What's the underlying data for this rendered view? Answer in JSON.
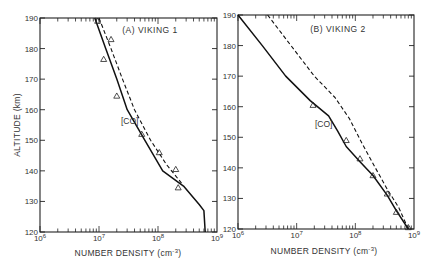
{
  "chart_data": [
    {
      "type": "line",
      "title": "(A) VIKING 1",
      "xlabel": "NUMBER DENSITY (cm⁻³)",
      "ylabel": "ALTITUDE (km)",
      "xscale": "log",
      "xlim": [
        1000000.0,
        1000000000.0
      ],
      "ylim": [
        120,
        190
      ],
      "x_tick_labels": [
        "10⁶",
        "10⁷",
        "10⁸",
        "10⁹"
      ],
      "y_tick_labels": [
        "120",
        "130",
        "140",
        "150",
        "160",
        "170",
        "180",
        "190"
      ],
      "grid": false,
      "annotations": [
        "[CO]"
      ],
      "series": [
        {
          "name": "model (solid)",
          "style": "solid",
          "points": [
            [
              8500000.0,
              190
            ],
            [
              13000000.0,
              180
            ],
            [
              20000000.0,
              170
            ],
            [
              30000000.0,
              160
            ],
            [
              60000000.0,
              150
            ],
            [
              120000000.0,
              140
            ],
            [
              270000000.0,
              135
            ],
            [
              500000000.0,
              129
            ],
            [
              600000000.0,
              127
            ],
            [
              630000000.0,
              120
            ]
          ]
        },
        {
          "name": "model (dashed)",
          "style": "dashed",
          "points": [
            [
              10000000.0,
              190
            ],
            [
              16000000.0,
              180
            ],
            [
              25000000.0,
              170
            ],
            [
              40000000.0,
              160
            ],
            [
              75000000.0,
              150
            ],
            [
              140000000.0,
              142
            ],
            [
              250000000.0,
              136
            ]
          ]
        },
        {
          "name": "measured",
          "style": "triangle-markers",
          "points": [
            [
              9500000.0,
              189
            ],
            [
              16000000.0,
              183
            ],
            [
              12000000.0,
              176.5
            ],
            [
              20000000.0,
              164.5
            ],
            [
              53000000.0,
              152
            ],
            [
              105000000.0,
              146
            ],
            [
              200000000.0,
              140.5
            ],
            [
              220000000.0,
              134.5
            ]
          ]
        }
      ]
    },
    {
      "type": "line",
      "title": "(B) VIKING 2",
      "xlabel": "NUMBER DENSITY (cm⁻³)",
      "ylabel": "ALTITUDE (km)",
      "xscale": "log",
      "xlim": [
        1000000.0,
        1000000000.0
      ],
      "ylim": [
        120,
        190
      ],
      "x_tick_labels": [
        "10⁶",
        "10⁷",
        "10⁸",
        "10⁹"
      ],
      "y_tick_labels": [
        "120",
        "130",
        "140",
        "150",
        "160",
        "170",
        "180",
        "190"
      ],
      "grid": false,
      "annotations": [
        "[CO]"
      ],
      "series": [
        {
          "name": "model (solid)",
          "style": "solid",
          "points": [
            [
              1000000.0,
              190
            ],
            [
              2600000.0,
              180
            ],
            [
              6500000.0,
              170
            ],
            [
              17000000.0,
              162
            ],
            [
              35000000.0,
              157
            ],
            [
              50000000.0,
              152
            ],
            [
              70000000.0,
              147
            ],
            [
              120000000.0,
              142
            ],
            [
              200000000.0,
              137.5
            ],
            [
              350000000.0,
              131
            ],
            [
              500000000.0,
              126
            ],
            [
              800000000.0,
              120
            ]
          ]
        },
        {
          "name": "model (dashed)",
          "style": "dashed",
          "points": [
            [
              3200000.0,
              190
            ],
            [
              8000000.0,
              180
            ],
            [
              20000000.0,
              170
            ],
            [
              45000000.0,
              163
            ],
            [
              80000000.0,
              156
            ],
            [
              130000000.0,
              148
            ],
            [
              220000000.0,
              140
            ],
            [
              350000000.0,
              133
            ],
            [
              550000000.0,
              127
            ],
            [
              800000000.0,
              120
            ]
          ]
        },
        {
          "name": "measured",
          "style": "triangle-markers",
          "points": [
            [
              19000000.0,
              160.5
            ],
            [
              70000000.0,
              149
            ],
            [
              120000000.0,
              143
            ],
            [
              200000000.0,
              137.5
            ],
            [
              350000000.0,
              131.5
            ],
            [
              500000000.0,
              125.5
            ],
            [
              800000000.0,
              120.5
            ]
          ]
        }
      ]
    }
  ],
  "labels": {
    "panel_a_title": "(A)  VIKING 1",
    "panel_b_title": "(B)  VIKING 2",
    "co_label": "[CO]",
    "ylabel": "ALTITUDE (km)",
    "xlabel_main": "NUMBER DENSITY (cm",
    "xlabel_exp": "-3",
    "xlabel_close": ")",
    "y_ticks": [
      "120",
      "130",
      "140",
      "150",
      "160",
      "170",
      "180",
      "190"
    ],
    "x_ticks_base": "10",
    "x_ticks_exp": [
      "6",
      "7",
      "8",
      "9"
    ]
  }
}
